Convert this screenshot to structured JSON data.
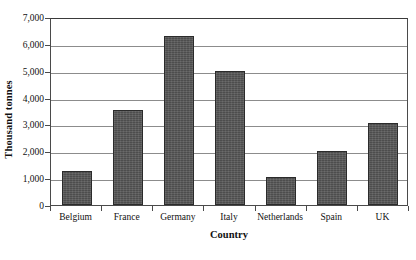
{
  "chart_data": {
    "type": "bar",
    "title": "",
    "xlabel": "Country",
    "ylabel": "Thousand tonnes",
    "categories": [
      "Belgium",
      "France",
      "Germany",
      "Italy",
      "Netherlands",
      "Spain",
      "UK"
    ],
    "values": [
      1250,
      3530,
      6280,
      5000,
      1030,
      2020,
      3050
    ],
    "ylim": [
      0,
      7000
    ],
    "ytick_values": [
      0,
      1000,
      2000,
      3000,
      4000,
      5000,
      6000,
      7000
    ],
    "ytick_labels": [
      "0",
      "1,000",
      "2,000",
      "3,000",
      "4,000",
      "5,000",
      "6,000",
      "7,000"
    ],
    "grid": true,
    "grid_axis": "y",
    "legend": false,
    "legend_position": "none",
    "bar_color": "#4d4d4d",
    "bar_edge_color": "#2b2b2b",
    "gridline_color": "#8c8c8c",
    "axis_color": "#4a4a4a",
    "background_color": "#ffffff",
    "text_color": "#111111"
  }
}
